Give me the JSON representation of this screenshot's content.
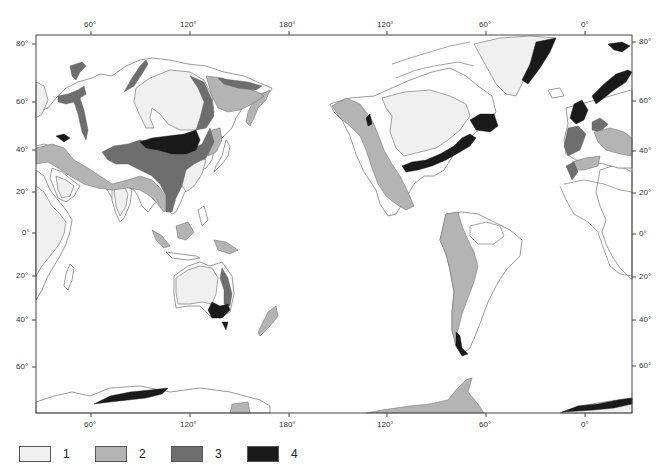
{
  "map": {
    "frame": {
      "left": 36,
      "top": 35,
      "right": 632,
      "bottom": 413
    },
    "top_axis": [
      {
        "label": "60°",
        "x": 91
      },
      {
        "label": "120°",
        "x": 190
      },
      {
        "label": "180°",
        "x": 289
      },
      {
        "label": "120°",
        "x": 387
      },
      {
        "label": "60°",
        "x": 486
      },
      {
        "label": "0°",
        "x": 585
      }
    ],
    "bottom_axis": [
      {
        "label": "60°",
        "x": 91
      },
      {
        "label": "120°",
        "x": 190
      },
      {
        "label": "180°",
        "x": 289
      },
      {
        "label": "120°",
        "x": 387
      },
      {
        "label": "60°",
        "x": 486
      },
      {
        "label": "0°",
        "x": 585
      }
    ],
    "left_axis": [
      {
        "label": "80°",
        "y": 44
      },
      {
        "label": "60°",
        "y": 102
      },
      {
        "label": "40°",
        "y": 150
      },
      {
        "label": "20°",
        "y": 192
      },
      {
        "label": "0°",
        "y": 233
      },
      {
        "label": "20°",
        "y": 276
      },
      {
        "label": "40°",
        "y": 320
      },
      {
        "label": "60°",
        "y": 367
      }
    ],
    "right_axis": [
      {
        "label": "80°",
        "y": 42
      },
      {
        "label": "60°",
        "y": 101
      },
      {
        "label": "40°",
        "y": 151
      },
      {
        "label": "20°",
        "y": 193
      },
      {
        "label": "0°",
        "y": 234
      },
      {
        "label": "20°",
        "y": 277
      },
      {
        "label": "40°",
        "y": 320
      },
      {
        "label": "60°",
        "y": 366
      }
    ]
  },
  "legend": {
    "items": [
      {
        "label": "1",
        "color": "#f0f0f0"
      },
      {
        "label": "2",
        "color": "#b4b4b4"
      },
      {
        "label": "3",
        "color": "#6e6e6e"
      },
      {
        "label": "4",
        "color": "#1a1a1a"
      }
    ]
  }
}
